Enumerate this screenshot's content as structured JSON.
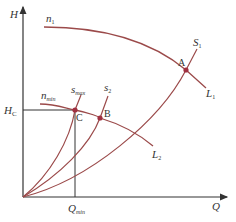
{
  "diagram": {
    "title": "",
    "axes": {
      "y_label": "H",
      "x_label": "Q",
      "h_c_label": "H",
      "h_c_sub": "C",
      "q_min_label": "Q",
      "q_min_sub": "min"
    },
    "speed_curves": [
      {
        "name": "n",
        "sub": "1"
      },
      {
        "name": "n",
        "sub": "min"
      }
    ],
    "system_curves": [
      {
        "name": "S",
        "sub": "1"
      },
      {
        "name": "s",
        "sub": "2"
      },
      {
        "name": "s",
        "sub": "max"
      }
    ],
    "line_labels": [
      {
        "name": "L",
        "sub": "1"
      },
      {
        "name": "L",
        "sub": "2"
      }
    ],
    "points": [
      "A",
      "B",
      "C"
    ],
    "colors": {
      "curve": "#9b4a4a",
      "axis": "#333333",
      "point": "#a03040"
    }
  }
}
